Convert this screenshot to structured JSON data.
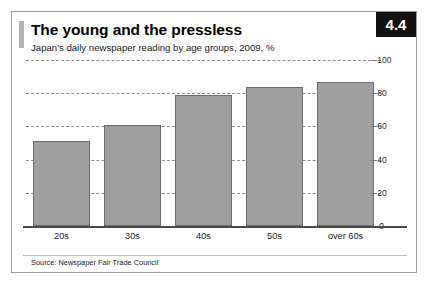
{
  "figure": {
    "number_badge": "4.4",
    "title": "The young and the pressless",
    "subtitle": "Japan's daily newspaper reading by age groups, 2009, %",
    "source": "Source: Newspaper Fair Trade Council",
    "accent_color": "#b3b3b3",
    "bar_color": "#9e9e9e",
    "bar_border_color": "#6d6d6d",
    "badge_bg": "#111111",
    "badge_text_color": "#ffffff",
    "frame_color": "#9b9b9b"
  },
  "chart_data": {
    "type": "bar",
    "title": "The young and the pressless",
    "subtitle": "Japan's daily newspaper reading by age groups, 2009, %",
    "categories": [
      "20s",
      "30s",
      "40s",
      "50s",
      "over 60s"
    ],
    "values": [
      51,
      61,
      79,
      84,
      87
    ],
    "xlabel": "",
    "ylabel": "",
    "ylim": [
      0,
      100
    ],
    "yticks": [
      0,
      20,
      40,
      60,
      80,
      100
    ],
    "ytick_labels": [
      "0",
      "20",
      "40",
      "60",
      "80",
      "100"
    ],
    "grid": true,
    "grid_style": "dashed",
    "legend": false,
    "source": "Source: Newspaper Fair Trade Council"
  }
}
